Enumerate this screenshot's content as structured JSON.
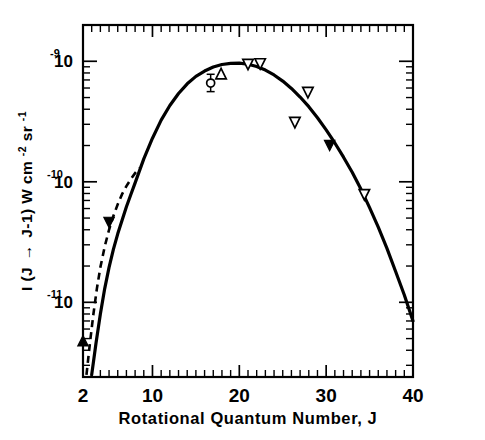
{
  "figure": {
    "background": "#ffffff",
    "ink_color": "#000000"
  },
  "chart_data": {
    "type": "line",
    "title": "",
    "subtitle": "",
    "xlabel": "Rotational Quantum Number, J",
    "ylabel": "I (J → J-1) W cm⁻² sr⁻¹",
    "ylabel_parts": {
      "lead": "I (J",
      "arrow": "→",
      "mid": "J-1)  W cm",
      "sup1": "-2",
      "unit2": " sr",
      "sup2": "-1"
    },
    "xlim": [
      2,
      40
    ],
    "ylim": [
      2.4e-12,
      2e-09
    ],
    "yscale": "log",
    "xscale": "linear",
    "grid": false,
    "legend": null,
    "x_ticks_major": [
      2,
      10,
      20,
      30,
      40
    ],
    "x_ticklabels": [
      "2",
      "10",
      "20",
      "30",
      "40"
    ],
    "x_tick_minor_step": 1,
    "y_ticks_major": [
      1e-09,
      1e-10,
      1e-11
    ],
    "y_ticklabels": [
      "10",
      "10",
      "10"
    ],
    "y_tick_exponents": [
      "-9",
      "-10",
      "-11"
    ],
    "ticks_direction": "in",
    "frame": "all-four-sides",
    "series": [
      {
        "name": "theory-solid",
        "style": "solid",
        "x": [
          3.0,
          3.5,
          4.0,
          4.5,
          5.0,
          5.5,
          6.0,
          6.5,
          7.0,
          7.5,
          8.0,
          9.0,
          10.0,
          11.0,
          12.0,
          13.0,
          14.0,
          15.0,
          16.0,
          17.0,
          18.0,
          19.0,
          20.0,
          21.0,
          22.0,
          23.0,
          24.0,
          25.0,
          26.0,
          27.0,
          28.0,
          29.0,
          30.0,
          31.0,
          32.0,
          33.0,
          34.0,
          35.0,
          36.0,
          37.0,
          38.0,
          39.0,
          40.0
        ],
        "y": [
          2.5e-12,
          4.6e-12,
          8e-12,
          1.3e-11,
          1.95e-11,
          2.75e-11,
          3.7e-11,
          4.8e-11,
          6.2e-11,
          7.8e-11,
          9.8e-11,
          1.55e-10,
          2.3e-10,
          3.25e-10,
          4.3e-10,
          5.4e-10,
          6.5e-10,
          7.5e-10,
          8.3e-10,
          8.95e-10,
          9.4e-10,
          9.6e-10,
          9.65e-10,
          9.45e-10,
          9.05e-10,
          8.45e-10,
          7.7e-10,
          6.85e-10,
          5.95e-10,
          5.05e-10,
          4.2e-10,
          3.4e-10,
          2.7e-10,
          2.1e-10,
          1.6e-10,
          1.2e-10,
          8.7e-11,
          6.1e-11,
          4.2e-11,
          2.8e-11,
          1.8e-11,
          1.15e-11,
          7e-12
        ]
      },
      {
        "name": "theory-dashed",
        "style": "dashed",
        "x": [
          2.4,
          2.8,
          3.2,
          3.6,
          4.0,
          4.5,
          5.0,
          5.5,
          6.0,
          6.5,
          7.0,
          7.5,
          8.0,
          8.5
        ],
        "y": [
          2.5e-12,
          4.6e-12,
          8e-12,
          1.3e-11,
          1.95e-11,
          2.9e-11,
          4e-11,
          5.2e-11,
          6.5e-11,
          7.9e-11,
          9.2e-11,
          1.05e-10,
          1.18e-10,
          1.3e-10
        ]
      }
    ],
    "points": [
      {
        "x": 2.0,
        "y": 4.8e-12,
        "marker": "triangle-up-filled",
        "err": null
      },
      {
        "x": 5.0,
        "y": 4.6e-11,
        "marker": "triangle-down-filled",
        "err": null
      },
      {
        "x": 16.7,
        "y": 6.6e-10,
        "marker": "circle-open",
        "err": {
          "low": 5.6e-10,
          "high": 7.8e-10
        }
      },
      {
        "x": 17.9,
        "y": 7.9e-10,
        "marker": "triangle-up-open",
        "err": null
      },
      {
        "x": 21.0,
        "y": 9.4e-10,
        "marker": "triangle-down-open",
        "err": null
      },
      {
        "x": 22.4,
        "y": 9.5e-10,
        "marker": "triangle-down-open",
        "err": null
      },
      {
        "x": 26.4,
        "y": 3.1e-10,
        "marker": "triangle-down-open",
        "err": null
      },
      {
        "x": 27.9,
        "y": 5.5e-10,
        "marker": "triangle-down-open",
        "err": null
      },
      {
        "x": 30.4,
        "y": 2e-10,
        "marker": "triangle-down-filled",
        "err": null
      },
      {
        "x": 34.4,
        "y": 7.8e-11,
        "marker": "triangle-down-open",
        "err": null
      }
    ]
  }
}
